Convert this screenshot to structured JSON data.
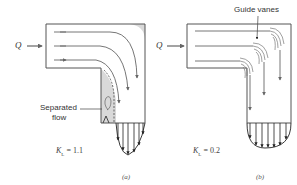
{
  "figure": {
    "panel_a": {
      "inlet_label": "Q",
      "annotation": "Separated\nflow",
      "annotation_line1": "Separated",
      "annotation_line2": "flow",
      "loss_coefficient_symbol": "K",
      "loss_coefficient_sub": "L",
      "loss_coefficient_value": "= 1.1",
      "caption": "(a)"
    },
    "panel_b": {
      "inlet_label": "Q",
      "annotation": "Guide vanes",
      "loss_coefficient_symbol": "K",
      "loss_coefficient_sub": "L",
      "loss_coefficient_value": "= 0.2",
      "caption": "(b)"
    },
    "colors": {
      "wall": "#555555",
      "streamline": "#666666",
      "separated_region": "#d9d9d9",
      "velocity_arrows": "#222222"
    }
  }
}
